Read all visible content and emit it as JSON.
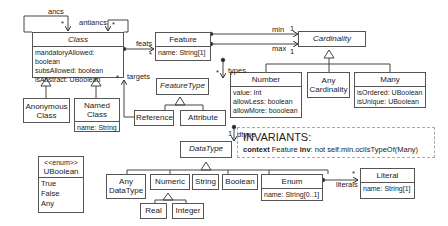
{
  "classes": {
    "class": {
      "name": "Class",
      "attrs": [
        "mandatoryAllowed: boolean",
        "subsAllowed: boolean",
        "isAbstract: UBoolean"
      ]
    },
    "anonymous_class": {
      "name": "Anonymous Class"
    },
    "named_class": {
      "name": "Named Class",
      "attrs": [
        "name: String"
      ]
    },
    "feature": {
      "name": "Feature",
      "attrs": [
        "name: String[1]"
      ]
    },
    "cardinality": {
      "name": "Cardinality"
    },
    "feature_type": {
      "name": "FeatureType"
    },
    "reference": {
      "name": "Reference"
    },
    "attribute": {
      "name": "Attribute"
    },
    "number": {
      "name": "Number",
      "attrs": [
        "value: Int",
        "allowLess: boolean",
        "allowMore: booolean"
      ]
    },
    "any_cardinality": {
      "name": "Any Cardinality"
    },
    "many": {
      "name": "Many",
      "attrs": [
        "isOrdered: UBoolean",
        "isUnique: UBoolean"
      ]
    },
    "data_type": {
      "name": "DataType"
    },
    "any_data_type": {
      "name": "Any DataType"
    },
    "numeric": {
      "name": "Numeric"
    },
    "string": {
      "name": "String"
    },
    "boolean": {
      "name": "Boolean"
    },
    "enum": {
      "name": "Enum",
      "attrs": [
        "name: String[0..1]"
      ]
    },
    "literal": {
      "name": "Literal",
      "attrs": [
        "name: String[1]"
      ]
    },
    "real": {
      "name": "Real"
    },
    "integer": {
      "name": "Integer"
    },
    "uboolean": {
      "stereotype": "<<enum>>",
      "name": "UBoolean",
      "literals": [
        "True",
        "False",
        "Any"
      ]
    }
  },
  "edge_labels": {
    "ancs": "ancs",
    "ancs_mult": "*",
    "antiancs": "antiancs",
    "antiancs_mult": "*",
    "feats": "feats",
    "feats_mult": "*",
    "targets": "targets",
    "targets_mult": "*",
    "types": "types",
    "types_mult": "*",
    "min": "min",
    "min_mult": "1",
    "max": "max",
    "max_mult": "1",
    "dtype": "dtype",
    "dtype_mult": "1",
    "literals": "literals",
    "literals_mult": "*"
  },
  "invariants": {
    "title": "INVARIANTS:",
    "keyword_context": "context",
    "context_class": "Feature",
    "keyword_inv": "inv",
    "expression": ": not self.min.oclIsTypeOf(Many)"
  }
}
